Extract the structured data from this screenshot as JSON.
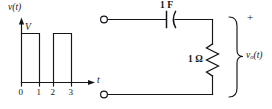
{
  "figure": {
    "type": "circuit-and-waveform-diagram",
    "background_color": "#ffffff",
    "ink_color": "#15161a"
  },
  "waveform": {
    "y_axis_label": "v(t)",
    "x_axis_label": "t",
    "amplitude_label": "V",
    "tick_labels": [
      "0",
      "1",
      "2",
      "3"
    ],
    "pulses": [
      {
        "start": 0,
        "end": 1,
        "height": "V"
      },
      {
        "start": 2,
        "end": 3,
        "height": "V"
      }
    ],
    "description": "Two rectangular pulses of amplitude V on intervals 0 to 1 and 2 to 3"
  },
  "circuit": {
    "capacitor": {
      "label": "1 F",
      "value": "1",
      "unit": "F",
      "orientation": "horizontal-series"
    },
    "resistor": {
      "label_value": "1",
      "label_unit": "Ω",
      "label": "1 Ω",
      "orientation": "vertical-shunt"
    },
    "output": {
      "label_main": "v",
      "label_sub": "o",
      "label_tail": "(t)",
      "label": "vₒ(t)",
      "polarity_plus": "+"
    },
    "terminals": {
      "top": "input-terminal-top",
      "bottom": "input-terminal-bottom"
    }
  }
}
